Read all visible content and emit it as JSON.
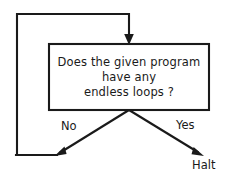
{
  "diagram": {
    "type": "flowchart",
    "background_color": "#ffffff",
    "line_color": "#1a1a1a",
    "text_color": "#1a1a1a",
    "decision": {
      "shape": "rectangle",
      "lines": [
        "Does the given program",
        "have any",
        "endless loops ?"
      ]
    },
    "branches": {
      "no_label": "No",
      "yes_label": "Yes"
    },
    "terminal": {
      "label": "Halt"
    }
  }
}
